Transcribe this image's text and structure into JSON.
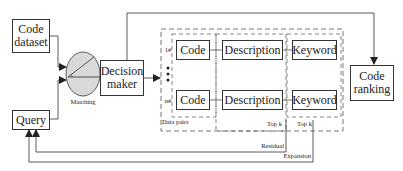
{
  "diagram": {
    "nodes": {
      "code_dataset": "Code dataset",
      "code_dataset_l1": "Code",
      "code_dataset_l2": "dataset",
      "query": "Query",
      "matching": "Matching",
      "decision_maker_l1": "Decision",
      "decision_maker_l2": "maker",
      "code_ranking_l1": "Code",
      "code_ranking_l2": "ranking"
    },
    "data_pairs": {
      "group_label": "Data pairs",
      "rows": [
        {
          "index": "1#",
          "code": "Code",
          "description": "Description",
          "keyword": "Keyword"
        },
        {
          "index": "n#",
          "code": "Code",
          "description": "Description",
          "keyword": "Keyword"
        }
      ],
      "ellipsis": "⋮",
      "topk_description": "Top k",
      "topk_keyword": "Top k"
    },
    "feedback": {
      "residual": "Residual",
      "expansion": "Expansion"
    },
    "colors": {
      "line": "#333333",
      "matching_fill": "#d9d9d9",
      "dashed": "#555555"
    }
  }
}
